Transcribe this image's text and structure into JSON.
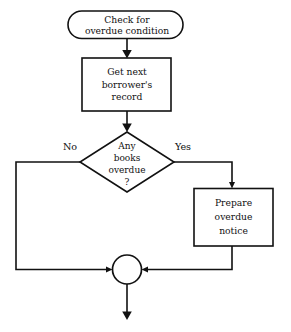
{
  "diagram": {
    "background_color": "#ffffff",
    "line_color": "#111111",
    "text_color": "#111111"
  },
  "nodes": {
    "terminal_start": {
      "shape": "rounded-terminal",
      "lines": [
        "Check for",
        "overdue condition"
      ]
    },
    "process_get_record": {
      "shape": "rectangle",
      "lines": [
        "Get next",
        "borrower's",
        "record"
      ]
    },
    "decision_overdue": {
      "shape": "diamond",
      "lines": [
        "Any",
        "books",
        "overdue",
        "?"
      ]
    },
    "process_prepare_notice": {
      "shape": "rectangle",
      "lines": [
        "Prepare",
        "overdue",
        "notice"
      ]
    },
    "connector_merge": {
      "shape": "circle",
      "label": ""
    }
  },
  "edges": {
    "branch_no_label": "No",
    "branch_yes_label": "Yes"
  }
}
